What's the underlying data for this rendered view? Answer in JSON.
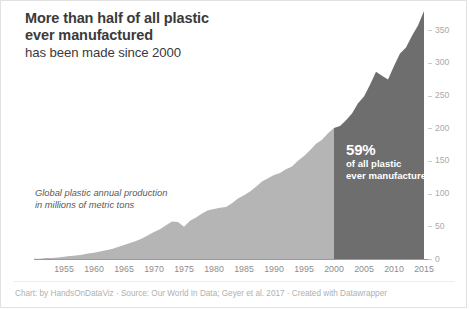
{
  "title": {
    "line1": "More than half of all plastic",
    "line2": "ever manufactured",
    "line3": "has been made since 2000"
  },
  "annotation": {
    "big": "59%",
    "small1": "of all plastic",
    "small2": "ever manufactured"
  },
  "plot_note": {
    "line1": "Global plastic annual production",
    "line2": "in millions of metric tons"
  },
  "footer": {
    "credit": "Chart: by HandsOnDataViz · Source: Our World In Data; Geyer et al. 2017 · Created with Datawrapper"
  },
  "colors": {
    "area_light": "#b5b5b5",
    "area_dark": "#6e6e6e",
    "axis": "#9a9a9a",
    "tick_label": "#8d8d8d",
    "y_tick_label": "#aaaaaa",
    "title": "#3a3a3a",
    "note": "#5a5a5a",
    "footer": "#b0b0b0",
    "annotation_text": "#ffffff",
    "card_border": "#e2e2e2",
    "background": "#ffffff"
  },
  "chart_data": {
    "type": "area",
    "title": "More than half of all plastic ever manufactured has been made since 2000",
    "subtitle": "Global plastic annual production in millions of metric tons",
    "xlabel": "",
    "ylabel": "",
    "xlim": [
      1950,
      2015
    ],
    "ylim": [
      0,
      381
    ],
    "grid": false,
    "legend": null,
    "highlight": {
      "from_year": 2000,
      "to_year": 2015,
      "label": "59% of all plastic ever manufactured",
      "color": "#6e6e6e"
    },
    "base_color": "#b5b5b5",
    "xticks": [
      1955,
      1960,
      1965,
      1970,
      1975,
      1980,
      1985,
      1990,
      1995,
      2000,
      2005,
      2010,
      2015
    ],
    "yticks": [
      0,
      50,
      100,
      150,
      200,
      250,
      300,
      350
    ],
    "x": [
      1950,
      1951,
      1952,
      1953,
      1954,
      1955,
      1956,
      1957,
      1958,
      1959,
      1960,
      1961,
      1962,
      1963,
      1964,
      1965,
      1966,
      1967,
      1968,
      1969,
      1970,
      1971,
      1972,
      1973,
      1974,
      1975,
      1976,
      1977,
      1978,
      1979,
      1980,
      1981,
      1982,
      1983,
      1984,
      1985,
      1986,
      1987,
      1988,
      1989,
      1990,
      1991,
      1992,
      1993,
      1994,
      1995,
      1996,
      1997,
      1998,
      1999,
      2000,
      2001,
      2002,
      2003,
      2004,
      2005,
      2006,
      2007,
      2008,
      2009,
      2010,
      2011,
      2012,
      2013,
      2014,
      2015
    ],
    "values": [
      2,
      2,
      3,
      3,
      4,
      5,
      6,
      7,
      8,
      10,
      11,
      13,
      15,
      17,
      20,
      23,
      26,
      29,
      33,
      38,
      43,
      47,
      53,
      59,
      58,
      51,
      60,
      65,
      71,
      76,
      78,
      80,
      81,
      87,
      94,
      99,
      105,
      112,
      120,
      125,
      130,
      133,
      139,
      143,
      152,
      159,
      168,
      178,
      184,
      194,
      202,
      205,
      214,
      224,
      240,
      250,
      268,
      288,
      282,
      276,
      297,
      316,
      325,
      343,
      359,
      381
    ],
    "source": "Our World In Data; Geyer et al. 2017"
  }
}
